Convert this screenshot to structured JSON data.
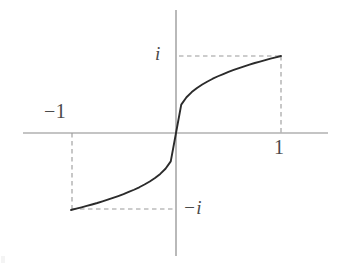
{
  "figure": {
    "title": "",
    "background_color": "#ffffff",
    "width": 344,
    "height": 266
  },
  "labels": {
    "positive_imaginary": "i",
    "positive_one": "1",
    "negative_one": "−1",
    "negative_imaginary": "−i",
    "minus_glyph": "−",
    "i_glyph": "i",
    "one_glyph": "1"
  },
  "colors": {
    "axis": "#8a8a8a",
    "curve": "#2b2b2b",
    "dashed_guide": "#9a9a9a",
    "label_text": "#4a4a4a",
    "background": "#ffffff"
  },
  "chart_data": {
    "type": "line",
    "title": "",
    "xlabel": "",
    "ylabel": "",
    "xlim": [
      -1.45,
      1.45
    ],
    "ylim": [
      -1.6,
      1.6
    ],
    "grid": false,
    "legend": null,
    "axes": {
      "x_axis_y_value": 0,
      "y_axis_x_value": 0,
      "x_axis_pixel_span": [
        23,
        328
      ],
      "y_axis_pixel_span": [
        10,
        256
      ],
      "origin_pixel": [
        176,
        133
      ]
    },
    "xticks": [
      -1,
      1
    ],
    "xticklabels": [
      "−1",
      "1"
    ],
    "yticks": [
      -1,
      1
    ],
    "yticklabels": [
      "−i",
      "i"
    ],
    "annotations": [
      {
        "text": "i",
        "x": 0,
        "y": 1,
        "pixel": [
          163,
          55
        ],
        "style": "italic"
      },
      {
        "text": "1",
        "x": 1,
        "y": 0,
        "pixel": [
          280,
          148
        ],
        "style": "normal"
      },
      {
        "text": "−1",
        "x": -1,
        "y": 0,
        "pixel": [
          60,
          113
        ],
        "style": "normal"
      },
      {
        "text": "−i",
        "x": 0,
        "y": -1,
        "pixel": [
          194,
          209
        ],
        "style": "italic"
      }
    ],
    "guides": [
      {
        "kind": "dashed-horizontal",
        "from": [
          0,
          1
        ],
        "to": [
          1,
          1
        ],
        "pixels": [
          [
            180,
            56
          ],
          [
            281,
            56
          ]
        ]
      },
      {
        "kind": "dashed-vertical",
        "from": [
          1,
          1
        ],
        "to": [
          1,
          0
        ],
        "pixels": [
          [
            281,
            56
          ],
          [
            281,
            133
          ]
        ]
      },
      {
        "kind": "dashed-horizontal",
        "from": [
          -1,
          -1
        ],
        "to": [
          0,
          -1
        ],
        "pixels": [
          [
            72,
            209
          ],
          [
            176,
            209
          ]
        ]
      },
      {
        "kind": "dashed-vertical",
        "from": [
          -1,
          0
        ],
        "to": [
          -1,
          -1
        ],
        "pixels": [
          [
            72,
            133
          ],
          [
            72,
            209
          ]
        ]
      }
    ],
    "series": [
      {
        "name": "odd sigmoid (cube-root style) curve",
        "endpoints": {
          "left": [
            -1,
            -1
          ],
          "right": [
            1,
            1
          ]
        },
        "x": [
          -1.0,
          -0.95,
          -0.9,
          -0.85,
          -0.8,
          -0.75,
          -0.7,
          -0.65,
          -0.6,
          -0.55,
          -0.5,
          -0.45,
          -0.4,
          -0.35,
          -0.3,
          -0.25,
          -0.2,
          -0.15,
          -0.1,
          -0.05,
          0.0,
          0.05,
          0.1,
          0.15,
          0.2,
          0.25,
          0.3,
          0.35,
          0.4,
          0.45,
          0.5,
          0.55,
          0.6,
          0.65,
          0.7,
          0.75,
          0.8,
          0.85,
          0.9,
          0.95,
          1.0
        ],
        "y": [
          -1.0,
          -0.983,
          -0.965,
          -0.947,
          -0.928,
          -0.909,
          -0.888,
          -0.866,
          -0.843,
          -0.819,
          -0.794,
          -0.766,
          -0.737,
          -0.705,
          -0.669,
          -0.63,
          -0.585,
          -0.531,
          -0.464,
          -0.368,
          0.0,
          0.368,
          0.464,
          0.531,
          0.585,
          0.63,
          0.669,
          0.705,
          0.737,
          0.766,
          0.794,
          0.819,
          0.843,
          0.866,
          0.888,
          0.909,
          0.928,
          0.947,
          0.965,
          0.983,
          1.0
        ]
      }
    ]
  }
}
